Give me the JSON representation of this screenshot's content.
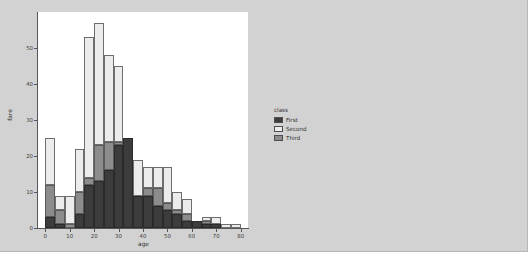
{
  "figure": {
    "background_color": "#d2d2d2",
    "plot_background_color": "#ffffff"
  },
  "legend": {
    "title": "class",
    "entries": [
      {
        "label": "First",
        "color": "#3c3c3c",
        "swatch": "legend-swatch-first"
      },
      {
        "label": "Second",
        "color": "#ececec",
        "swatch": "legend-swatch-second"
      },
      {
        "label": "Third",
        "color": "#8c8c8c",
        "swatch": "legend-swatch-third"
      }
    ]
  },
  "chart_data": {
    "type": "bar",
    "title": "",
    "subtitle": "",
    "xlabel": "age",
    "ylabel": "fare",
    "xlim": [
      -3,
      83
    ],
    "ylim": [
      0,
      60
    ],
    "xticks": [
      0,
      10,
      20,
      30,
      40,
      50,
      60,
      70,
      80
    ],
    "yticks": [
      0,
      10,
      20,
      30,
      40,
      50
    ],
    "grid": false,
    "stacked": true,
    "legend_position": "right",
    "bin_width": 4,
    "bin_starts": [
      0,
      4,
      8,
      12,
      16,
      20,
      24,
      28,
      32,
      36,
      40,
      44,
      48,
      52,
      56,
      60,
      64,
      68,
      72,
      76,
      80
    ],
    "series": [
      {
        "name": "First",
        "color": "#3c3c3c",
        "values": [
          3,
          1,
          0,
          4,
          12,
          13,
          16,
          23,
          25,
          9,
          9,
          6,
          5,
          4,
          2,
          2,
          1,
          1,
          0,
          0,
          0
        ]
      },
      {
        "name": "Third",
        "color": "#8c8c8c",
        "values": [
          9,
          4,
          1,
          6,
          2,
          10,
          8,
          1,
          0,
          0,
          2,
          5,
          2,
          1,
          2,
          0,
          1,
          0,
          0,
          0,
          0
        ]
      },
      {
        "name": "Second",
        "color": "#ececec",
        "values": [
          13,
          4,
          8,
          12,
          39,
          34,
          24,
          21,
          0,
          10,
          6,
          6,
          10,
          5,
          4,
          0,
          1,
          2,
          1,
          1,
          0
        ]
      }
    ],
    "totals": [
      25,
      9,
      9,
      22,
      53,
      57,
      48,
      45,
      25,
      19,
      17,
      17,
      17,
      10,
      8,
      2,
      3,
      3,
      1,
      1,
      0
    ]
  }
}
